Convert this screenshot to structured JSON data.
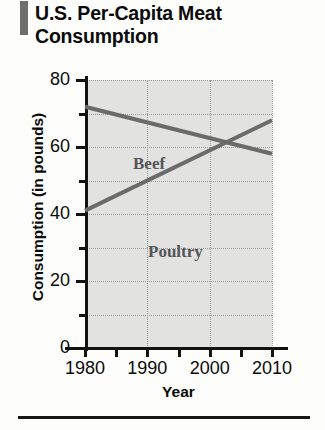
{
  "title": "U.S. Per-Capita Meat Consumption",
  "colors": {
    "accent_bar": "#6e6e6e",
    "plot_background": "#e2e2e0",
    "gridline": "#9a9a98",
    "axis": "#121212",
    "series_line": "#6b6b6b",
    "series_label": "#55555a",
    "title_text": "#0b0b0b"
  },
  "chart_data": {
    "type": "line",
    "title": "U.S. Per-Capita Meat Consumption",
    "xlabel": "Year",
    "ylabel": "Consumption (in pounds)",
    "xlim": [
      1980,
      2010
    ],
    "ylim": [
      0,
      80
    ],
    "grid": true,
    "legend": "inline-labels",
    "x_ticks_major": [
      1980,
      1990,
      2000,
      2010
    ],
    "x_ticks_minor": [
      1985,
      1995,
      2005
    ],
    "x_tick_labels": [
      "1980",
      "1990",
      "2000",
      "2010"
    ],
    "y_ticks_major": [
      0,
      20,
      40,
      60,
      80
    ],
    "y_ticks_minor": [
      10,
      30,
      50,
      70
    ],
    "y_tick_labels": [
      "0",
      "20",
      "40",
      "60",
      "80"
    ],
    "series": [
      {
        "name": "Beef",
        "x": [
          1980,
          2010
        ],
        "values": [
          72,
          58
        ]
      },
      {
        "name": "Poultry",
        "x": [
          1980,
          2010
        ],
        "values": [
          41,
          68
        ]
      }
    ],
    "annotations": [
      {
        "text": "Beef",
        "x": 1991,
        "y": 75
      },
      {
        "text": "Poultry",
        "x": 1994,
        "y": 48
      }
    ],
    "intersection": {
      "x": 2000,
      "y": 62
    }
  }
}
